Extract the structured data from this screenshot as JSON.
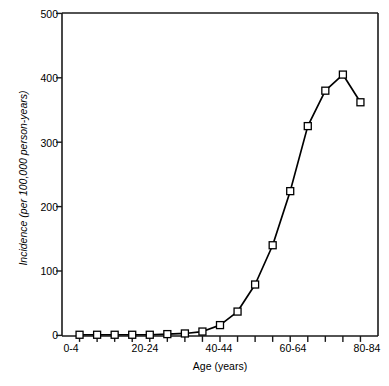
{
  "chart_data": {
    "type": "line",
    "title": "",
    "xlabel": "Age (years)",
    "ylabel": "Incidence (per 100,000 person-years)",
    "categories": [
      "0-4",
      "5-9",
      "10-14",
      "15-19",
      "20-24",
      "25-29",
      "30-34",
      "35-39",
      "40-44",
      "45-49",
      "50-54",
      "55-59",
      "60-64",
      "65-69",
      "70-74",
      "75-79",
      "80-84"
    ],
    "values": [
      1,
      1,
      1,
      1,
      1,
      2,
      3,
      6,
      16,
      37,
      79,
      140,
      224,
      325,
      380,
      405,
      362
    ],
    "xlim": [
      0,
      17
    ],
    "ylim": [
      0,
      500
    ],
    "yticks": [
      0,
      100,
      200,
      300,
      400,
      500
    ],
    "ytick_labels": [
      "0",
      "100",
      "200",
      "300",
      "400",
      "500"
    ],
    "xtick_labels": [
      "0-4",
      "20-24",
      "40-44",
      "60-64",
      "80-84"
    ],
    "xtick_label_indices": [
      0,
      4,
      8,
      12,
      16
    ],
    "marker": "open-square",
    "marker_size": 7,
    "line_color": "#000000",
    "marker_fill": "#ffffff",
    "marker_edge": "#000000",
    "grid": false,
    "legend": false
  },
  "axes": {
    "frame_color": "#1a1a1a",
    "tick_direction": "out"
  }
}
